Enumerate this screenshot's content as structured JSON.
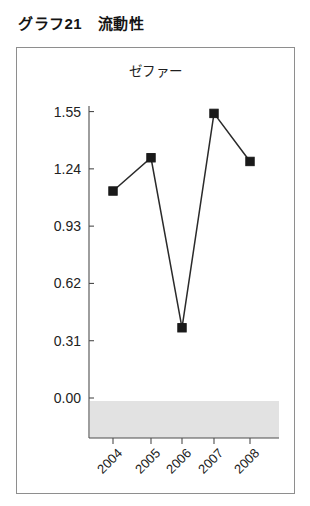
{
  "figure": {
    "heading": "グラフ21　流動性"
  },
  "chart_data": {
    "type": "line",
    "title": "ゼファー",
    "xlabel": "",
    "ylabel": "",
    "categories": [
      "2004",
      "2005",
      "2006",
      "2007",
      "2008"
    ],
    "values": [
      1.12,
      1.3,
      0.38,
      1.54,
      1.28
    ],
    "series": [
      {
        "name": "ゼファー",
        "values": [
          1.12,
          1.3,
          0.38,
          1.54,
          1.28
        ]
      }
    ],
    "ytick_labels": [
      "1.55",
      "1.24",
      "0.93",
      "0.62",
      "0.31",
      "0.00"
    ],
    "ytick_values": [
      1.55,
      1.24,
      0.93,
      0.62,
      0.31,
      0.0
    ],
    "ylim": [
      0.0,
      1.55
    ],
    "xlim_categories": [
      "2004",
      "2008"
    ],
    "grid": false,
    "legend": false,
    "marker": "square",
    "marker_color": "#1a1a1a",
    "line_color": "#2a2a2a",
    "shade_band_color": "#e2e2e2",
    "xtick_label_rotation": -45
  },
  "geometry": {
    "axis_x": 72,
    "axis_top": 58,
    "axis_bottom": 390,
    "y_zero": 350,
    "y_per_unit": 184.8,
    "x_positions": [
      96,
      134,
      165,
      197,
      233
    ],
    "band_top": 353,
    "band_bottom": 390,
    "band_left": 73,
    "band_right": 262
  }
}
